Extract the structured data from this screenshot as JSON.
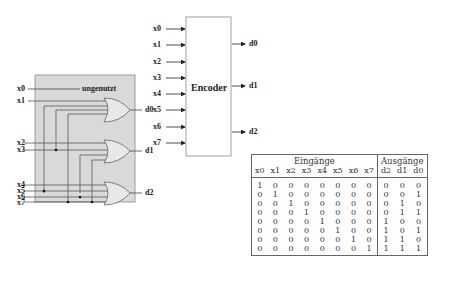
{
  "circuit": {
    "inputs": [
      "x0",
      "x1",
      "x2",
      "x3",
      "x4",
      "x5",
      "x6",
      "x7"
    ],
    "unused_label": "ungenutzt",
    "outputs": [
      "d0",
      "d1",
      "d2"
    ],
    "background_color": "#d9d9d9"
  },
  "encoder_block": {
    "title": "Encoder",
    "inputs": [
      "x0",
      "x1",
      "x2",
      "x3",
      "x4",
      "x5",
      "x6",
      "x7"
    ],
    "outputs": [
      "d0",
      "d1",
      "d2"
    ]
  },
  "truth_table": {
    "group_inputs": "Eingänge",
    "group_outputs": "Ausgänge",
    "input_headers": [
      "x0",
      "x1",
      "x2",
      "x3",
      "x4",
      "x5",
      "x6",
      "x7"
    ],
    "output_headers": [
      "d2",
      "d1",
      "d0"
    ],
    "rows": [
      {
        "in": [
          "1",
          "0",
          "0",
          "0",
          "0",
          "0",
          "0",
          "0"
        ],
        "out": [
          "0",
          "0",
          "0"
        ]
      },
      {
        "in": [
          "0",
          "1",
          "0",
          "0",
          "0",
          "0",
          "0",
          "0"
        ],
        "out": [
          "0",
          "0",
          "1"
        ]
      },
      {
        "in": [
          "0",
          "0",
          "1",
          "0",
          "0",
          "0",
          "0",
          "0"
        ],
        "out": [
          "0",
          "1",
          "0"
        ]
      },
      {
        "in": [
          "0",
          "0",
          "0",
          "1",
          "0",
          "0",
          "0",
          "0"
        ],
        "out": [
          "0",
          "1",
          "1"
        ]
      },
      {
        "in": [
          "0",
          "0",
          "0",
          "0",
          "1",
          "0",
          "0",
          "0"
        ],
        "out": [
          "1",
          "0",
          "0"
        ]
      },
      {
        "in": [
          "0",
          "0",
          "0",
          "0",
          "0",
          "1",
          "0",
          "0"
        ],
        "out": [
          "1",
          "0",
          "1"
        ]
      },
      {
        "in": [
          "0",
          "0",
          "0",
          "0",
          "0",
          "0",
          "1",
          "0"
        ],
        "out": [
          "1",
          "1",
          "0"
        ]
      },
      {
        "in": [
          "0",
          "0",
          "0",
          "0",
          "0",
          "0",
          "0",
          "1"
        ],
        "out": [
          "1",
          "1",
          "1"
        ]
      }
    ]
  }
}
